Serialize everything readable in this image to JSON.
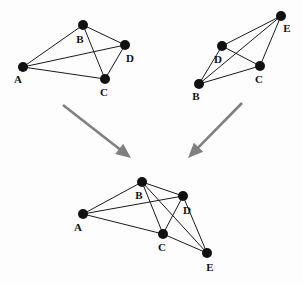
{
  "figure": {
    "width": 303,
    "height": 284,
    "background_color": "#fdfdfd",
    "node_color": "#111111",
    "edge_color": "#1a1a1a",
    "arrow_color": "#808080",
    "node_radius": 5
  },
  "graphs": [
    {
      "id": "graph-top-left",
      "name": "Top left graph",
      "node_count": 4,
      "edge_count": 6,
      "nodes": [
        {
          "id": "A",
          "label": "A",
          "x": 23,
          "y": 67,
          "label_x": 18,
          "label_y": 80
        },
        {
          "id": "B",
          "label": "B",
          "x": 83,
          "y": 25,
          "label_x": 80,
          "label_y": 40
        },
        {
          "id": "C",
          "label": "C",
          "x": 105,
          "y": 79,
          "label_x": 104,
          "label_y": 93
        },
        {
          "id": "D",
          "label": "D",
          "x": 125,
          "y": 45,
          "label_x": 130,
          "label_y": 59
        }
      ],
      "edges": [
        {
          "from": "A",
          "to": "B"
        },
        {
          "from": "A",
          "to": "C"
        },
        {
          "from": "A",
          "to": "D"
        },
        {
          "from": "B",
          "to": "C"
        },
        {
          "from": "B",
          "to": "D"
        },
        {
          "from": "C",
          "to": "D"
        }
      ]
    },
    {
      "id": "graph-top-right",
      "name": "Top right graph",
      "node_count": 4,
      "edge_count": 6,
      "nodes": [
        {
          "id": "B",
          "label": "B",
          "x": 199,
          "y": 84,
          "label_x": 196,
          "label_y": 97
        },
        {
          "id": "C",
          "label": "C",
          "x": 260,
          "y": 66,
          "label_x": 259,
          "label_y": 80
        },
        {
          "id": "D",
          "label": "D",
          "x": 222,
          "y": 46,
          "label_x": 218,
          "label_y": 60
        },
        {
          "id": "E",
          "label": "E",
          "x": 281,
          "y": 16,
          "label_x": 287,
          "label_y": 29
        }
      ],
      "edges": [
        {
          "from": "B",
          "to": "C"
        },
        {
          "from": "B",
          "to": "D"
        },
        {
          "from": "B",
          "to": "E"
        },
        {
          "from": "C",
          "to": "D"
        },
        {
          "from": "C",
          "to": "E"
        },
        {
          "from": "D",
          "to": "E"
        }
      ]
    },
    {
      "id": "graph-bottom-merged",
      "name": "Bottom merged graph",
      "node_count": 5,
      "edge_count": 9,
      "nodes": [
        {
          "id": "A",
          "label": "A",
          "x": 83,
          "y": 214,
          "label_x": 78,
          "label_y": 228
        },
        {
          "id": "B",
          "label": "B",
          "x": 142,
          "y": 182,
          "label_x": 139,
          "label_y": 196
        },
        {
          "id": "C",
          "label": "C",
          "x": 163,
          "y": 234,
          "label_x": 162,
          "label_y": 248
        },
        {
          "id": "D",
          "label": "D",
          "x": 183,
          "y": 196,
          "label_x": 187,
          "label_y": 211
        },
        {
          "id": "E",
          "label": "E",
          "x": 207,
          "y": 253,
          "label_x": 210,
          "label_y": 268
        }
      ],
      "edges": [
        {
          "from": "A",
          "to": "B"
        },
        {
          "from": "A",
          "to": "C"
        },
        {
          "from": "A",
          "to": "D"
        },
        {
          "from": "B",
          "to": "C"
        },
        {
          "from": "B",
          "to": "D"
        },
        {
          "from": "B",
          "to": "E"
        },
        {
          "from": "C",
          "to": "D"
        },
        {
          "from": "C",
          "to": "E"
        },
        {
          "from": "D",
          "to": "E"
        }
      ]
    }
  ],
  "arrows": [
    {
      "id": "arrow-left",
      "name": "Arrow from top left graph to merged graph",
      "x1": 63,
      "y1": 105,
      "x2": 131,
      "y2": 158
    },
    {
      "id": "arrow-right",
      "name": "Arrow from top right graph to merged graph",
      "x1": 242,
      "y1": 103,
      "x2": 188,
      "y2": 158
    }
  ]
}
